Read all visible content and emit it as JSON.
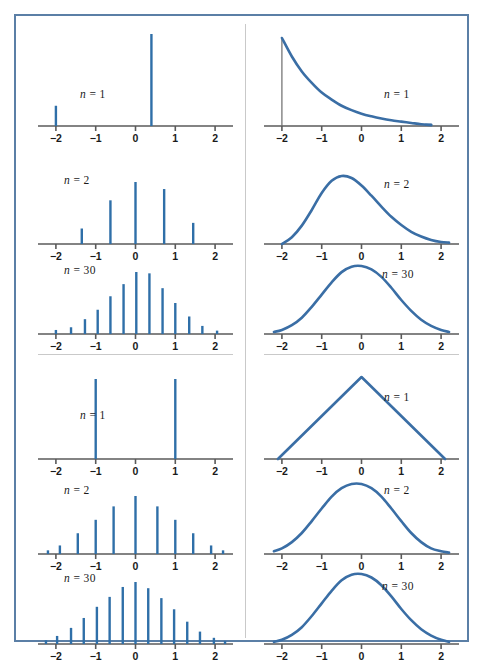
{
  "figure": {
    "border_color": "#5b7fa6",
    "background": "#ffffff",
    "stem_color": "#2f6fa8",
    "curve_color": "#3a6ea5",
    "axis_color": "#5a5a5a",
    "divider_color": "#c9c9c9"
  },
  "axis": {
    "ticks": [
      "−2",
      "−1",
      "0",
      "1",
      "2"
    ],
    "tick_values": [
      -2,
      -1,
      0,
      1,
      2
    ],
    "xmin": -2.45,
    "xmax": 2.45
  },
  "labels": {
    "n1": "n = 1",
    "n2": "n = 2",
    "n30": "n = 30"
  },
  "chart_data": [
    {
      "id": "tl-n1",
      "type": "bar",
      "title": "n = 1",
      "quadrant": "top-left",
      "xlabel": "",
      "ylabel": "",
      "xlim": [
        -2.45,
        2.45
      ],
      "grid": false,
      "legend": "none",
      "x": [
        -2.0,
        0.4
      ],
      "values": [
        0.22,
        1.0
      ]
    },
    {
      "id": "tl-n2",
      "type": "bar",
      "title": "n = 2",
      "quadrant": "top-left",
      "xlabel": "",
      "ylabel": "",
      "xlim": [
        -2.45,
        2.45
      ],
      "grid": false,
      "legend": "none",
      "x": [
        -1.35,
        -0.63,
        0.0,
        0.72,
        1.45
      ],
      "values": [
        0.22,
        0.62,
        0.88,
        0.78,
        0.3
      ]
    },
    {
      "id": "tl-n30",
      "type": "bar",
      "title": "n = 30",
      "quadrant": "top-left",
      "xlabel": "",
      "ylabel": "",
      "xlim": [
        -2.45,
        2.45
      ],
      "grid": false,
      "legend": "none",
      "x": [
        -2.0,
        -1.62,
        -1.27,
        -0.95,
        -0.63,
        -0.3,
        0.02,
        0.35,
        0.68,
        1.0,
        1.35,
        1.68,
        2.05
      ],
      "values": [
        0.06,
        0.1,
        0.22,
        0.36,
        0.56,
        0.74,
        0.92,
        0.9,
        0.68,
        0.46,
        0.26,
        0.12,
        0.05
      ]
    },
    {
      "id": "tr-n1",
      "type": "line",
      "title": "n = 1",
      "quadrant": "top-right",
      "xlabel": "",
      "ylabel": "",
      "xlim": [
        -2.45,
        2.45
      ],
      "grid": false,
      "legend": "none",
      "shape": "exponential",
      "x": [
        -2.0,
        -1.75,
        -1.5,
        -1.25,
        -1.0,
        -0.75,
        -0.5,
        -0.25,
        0.0,
        0.25,
        0.5,
        0.75,
        1.0,
        1.25,
        1.5,
        1.75
      ],
      "values": [
        1.0,
        0.79,
        0.62,
        0.49,
        0.38,
        0.3,
        0.23,
        0.18,
        0.14,
        0.11,
        0.085,
        0.065,
        0.05,
        0.035,
        0.02,
        0.01
      ]
    },
    {
      "id": "tr-n2",
      "type": "line",
      "title": "n = 2",
      "quadrant": "top-right",
      "xlabel": "",
      "ylabel": "",
      "xlim": [
        -2.45,
        2.45
      ],
      "grid": false,
      "legend": "none",
      "shape": "skewed-bell",
      "x": [
        -2.0,
        -1.75,
        -1.5,
        -1.25,
        -1.0,
        -0.75,
        -0.5,
        -0.25,
        0.0,
        0.25,
        0.5,
        0.75,
        1.0,
        1.25,
        1.5,
        1.75,
        2.0,
        2.2
      ],
      "values": [
        0.0,
        0.1,
        0.27,
        0.5,
        0.75,
        0.93,
        1.0,
        0.97,
        0.86,
        0.71,
        0.55,
        0.4,
        0.28,
        0.18,
        0.11,
        0.06,
        0.03,
        0.02
      ]
    },
    {
      "id": "tr-n30",
      "type": "line",
      "title": "n = 30",
      "quadrant": "top-right",
      "xlabel": "",
      "ylabel": "",
      "xlim": [
        -2.45,
        2.45
      ],
      "grid": false,
      "legend": "none",
      "shape": "bell",
      "x": [
        -2.2,
        -2.0,
        -1.75,
        -1.5,
        -1.25,
        -1.0,
        -0.75,
        -0.5,
        -0.25,
        0.0,
        0.25,
        0.5,
        0.75,
        1.0,
        1.25,
        1.5,
        1.75,
        2.0,
        2.2
      ],
      "values": [
        0.03,
        0.06,
        0.13,
        0.24,
        0.4,
        0.58,
        0.76,
        0.91,
        0.99,
        1.0,
        0.95,
        0.84,
        0.68,
        0.5,
        0.34,
        0.21,
        0.12,
        0.06,
        0.03
      ]
    },
    {
      "id": "bl-n1",
      "type": "bar",
      "title": "n = 1",
      "quadrant": "bottom-left",
      "xlabel": "",
      "ylabel": "",
      "xlim": [
        -2.45,
        2.45
      ],
      "grid": false,
      "legend": "none",
      "x": [
        -1.0,
        1.0
      ],
      "values": [
        1.0,
        1.0
      ]
    },
    {
      "id": "bl-n2",
      "type": "bar",
      "title": "n = 2",
      "quadrant": "bottom-left",
      "xlabel": "",
      "ylabel": "",
      "xlim": [
        -2.45,
        2.45
      ],
      "grid": false,
      "legend": "none",
      "x": [
        -2.2,
        -1.9,
        -1.45,
        -1.0,
        -0.55,
        0.0,
        0.55,
        1.0,
        1.45,
        1.9,
        2.2
      ],
      "values": [
        0.06,
        0.14,
        0.34,
        0.56,
        0.78,
        0.95,
        0.78,
        0.56,
        0.34,
        0.14,
        0.06
      ]
    },
    {
      "id": "bl-n30",
      "type": "bar",
      "title": "n = 30",
      "quadrant": "bottom-left",
      "xlabel": "",
      "ylabel": "",
      "xlim": [
        -2.45,
        2.45
      ],
      "grid": false,
      "legend": "none",
      "x": [
        -2.25,
        -1.97,
        -1.62,
        -1.3,
        -0.97,
        -0.65,
        -0.32,
        0.0,
        0.32,
        0.65,
        0.97,
        1.3,
        1.62,
        1.97,
        2.25
      ],
      "values": [
        0.06,
        0.13,
        0.26,
        0.42,
        0.6,
        0.76,
        0.92,
        1.0,
        0.9,
        0.74,
        0.56,
        0.36,
        0.2,
        0.1,
        0.05
      ]
    },
    {
      "id": "br-n1",
      "type": "line",
      "title": "n = 1",
      "quadrant": "bottom-right",
      "xlabel": "",
      "ylabel": "",
      "xlim": [
        -2.45,
        2.45
      ],
      "grid": false,
      "legend": "none",
      "shape": "triangular",
      "x": [
        -2.1,
        0.0,
        2.1
      ],
      "values": [
        0.0,
        1.0,
        0.0
      ]
    },
    {
      "id": "br-n2",
      "type": "line",
      "title": "n = 2",
      "quadrant": "bottom-right",
      "xlabel": "",
      "ylabel": "",
      "xlim": [
        -2.45,
        2.45
      ],
      "grid": false,
      "legend": "none",
      "shape": "bell",
      "x": [
        -2.2,
        -2.0,
        -1.75,
        -1.5,
        -1.25,
        -1.0,
        -0.75,
        -0.5,
        -0.25,
        0.0,
        0.25,
        0.5,
        0.75,
        1.0,
        1.25,
        1.5,
        1.75,
        2.0,
        2.2
      ],
      "values": [
        0.04,
        0.08,
        0.17,
        0.3,
        0.47,
        0.65,
        0.82,
        0.94,
        1.0,
        1.0,
        0.94,
        0.82,
        0.65,
        0.47,
        0.3,
        0.17,
        0.08,
        0.04,
        0.02
      ]
    },
    {
      "id": "br-n30",
      "type": "line",
      "title": "n = 30",
      "quadrant": "bottom-right",
      "xlabel": "",
      "ylabel": "",
      "xlim": [
        -2.45,
        2.45
      ],
      "grid": false,
      "legend": "none",
      "shape": "bell",
      "x": [
        -2.2,
        -2.0,
        -1.75,
        -1.5,
        -1.25,
        -1.0,
        -0.75,
        -0.5,
        -0.25,
        0.0,
        0.25,
        0.5,
        0.75,
        1.0,
        1.25,
        1.5,
        1.75,
        2.0,
        2.2
      ],
      "values": [
        0.03,
        0.06,
        0.13,
        0.24,
        0.4,
        0.58,
        0.76,
        0.91,
        0.99,
        1.0,
        0.95,
        0.84,
        0.68,
        0.5,
        0.34,
        0.21,
        0.12,
        0.06,
        0.03
      ]
    }
  ],
  "panels": [
    {
      "id": "tl-n1",
      "left": 22,
      "top": 10,
      "width": 195,
      "height": 120,
      "axis_y": 100,
      "plot_h": 92,
      "label_x": 42,
      "label_y": 62,
      "label_key": "n1"
    },
    {
      "id": "tl-n2",
      "left": 22,
      "top": 150,
      "width": 195,
      "height": 105,
      "axis_y": 78,
      "plot_h": 62,
      "label_x": 26,
      "label_y": 8,
      "label_key": "n2"
    },
    {
      "id": "tl-n30",
      "left": 22,
      "top": 240,
      "width": 195,
      "height": 105,
      "axis_y": 78,
      "plot_h": 62,
      "label_x": 26,
      "label_y": 8,
      "label_key": "n30"
    },
    {
      "id": "bl-n1",
      "left": 22,
      "top": 345,
      "width": 195,
      "height": 120,
      "axis_y": 98,
      "plot_h": 80,
      "label_x": 42,
      "label_y": 48,
      "label_key": "n1"
    },
    {
      "id": "bl-n2",
      "left": 22,
      "top": 460,
      "width": 195,
      "height": 105,
      "axis_y": 78,
      "plot_h": 58,
      "label_x": 26,
      "label_y": 8,
      "label_key": "n2"
    },
    {
      "id": "bl-n30",
      "left": 22,
      "top": 550,
      "width": 195,
      "height": 108,
      "axis_y": 78,
      "plot_h": 62,
      "label_x": 26,
      "label_y": 6,
      "label_key": "n30"
    },
    {
      "id": "tr-n1",
      "left": 248,
      "top": 10,
      "width": 195,
      "height": 120,
      "axis_y": 100,
      "plot_h": 88,
      "label_x": 120,
      "label_y": 62,
      "label_key": "n1"
    },
    {
      "id": "tr-n2",
      "left": 248,
      "top": 150,
      "width": 195,
      "height": 105,
      "axis_y": 78,
      "plot_h": 68,
      "label_x": 120,
      "label_y": 12,
      "label_key": "n2"
    },
    {
      "id": "tr-n30",
      "left": 248,
      "top": 240,
      "width": 195,
      "height": 105,
      "axis_y": 78,
      "plot_h": 68,
      "label_x": 118,
      "label_y": 12,
      "label_key": "n30"
    },
    {
      "id": "br-n1",
      "left": 248,
      "top": 345,
      "width": 195,
      "height": 120,
      "axis_y": 98,
      "plot_h": 82,
      "label_x": 120,
      "label_y": 30,
      "label_key": "n1"
    },
    {
      "id": "br-n2",
      "left": 248,
      "top": 460,
      "width": 195,
      "height": 105,
      "axis_y": 78,
      "plot_h": 70,
      "label_x": 120,
      "label_y": 8,
      "label_key": "n2"
    },
    {
      "id": "br-n30",
      "left": 248,
      "top": 550,
      "width": 195,
      "height": 108,
      "axis_y": 78,
      "plot_h": 70,
      "label_x": 118,
      "label_y": 14,
      "label_key": "n30"
    }
  ],
  "dividers": {
    "vertical": {
      "x": 229,
      "y": 8,
      "height": 614,
      "width": 1
    },
    "horizontal_left": {
      "x": 22,
      "y": 338,
      "width": 195
    },
    "horizontal_right": {
      "x": 248,
      "y": 338,
      "width": 195
    }
  }
}
